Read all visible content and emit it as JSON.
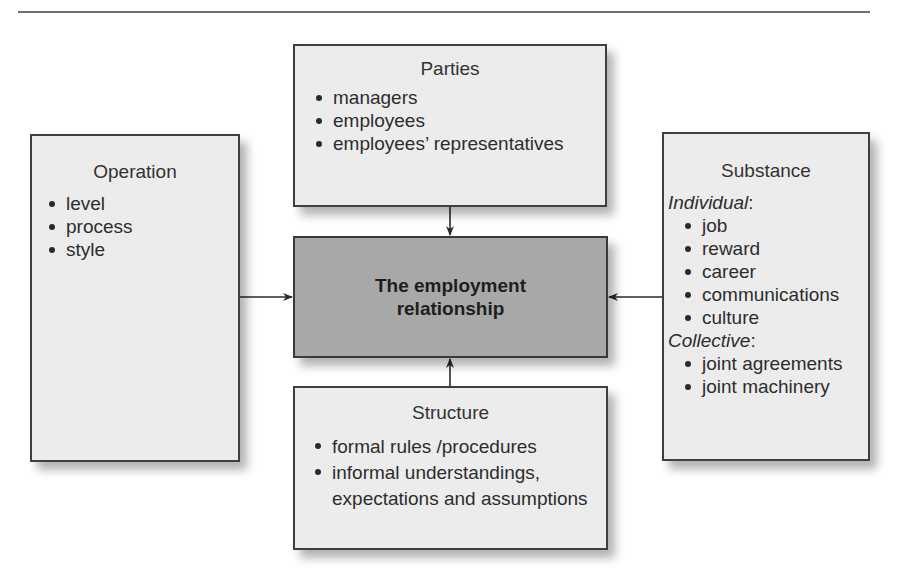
{
  "figure": {
    "center": {
      "label": "The employment relationship"
    },
    "parties": {
      "title": "Parties",
      "items": [
        "managers",
        "employees",
        "employees’ representatives"
      ]
    },
    "operation": {
      "title": "Operation",
      "items": [
        "level",
        "process",
        "style"
      ]
    },
    "substance": {
      "title": "Substance",
      "groups": [
        {
          "heading": "Individual",
          "items": [
            "job",
            "reward",
            "career",
            "communications",
            "culture"
          ]
        },
        {
          "heading": "Collective",
          "items": [
            "joint agreements",
            "joint machinery"
          ]
        }
      ]
    },
    "structure": {
      "title": "Structure",
      "items": [
        "formal rules /procedures",
        "informal understandings, expectations and assumptions"
      ]
    },
    "connections": [
      {
        "from": "parties",
        "to": "center",
        "direction": "down"
      },
      {
        "from": "operation",
        "to": "center",
        "direction": "right"
      },
      {
        "from": "substance",
        "to": "center",
        "direction": "left"
      },
      {
        "from": "structure",
        "to": "center",
        "direction": "up"
      }
    ],
    "colors": {
      "box_fill": "#ececec",
      "center_fill": "#a8a8a8",
      "border": "#3f3f3f",
      "rule": "#6e6e6e"
    }
  }
}
